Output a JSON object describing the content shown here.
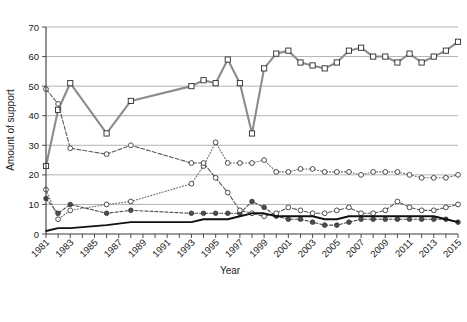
{
  "chart_data": {
    "type": "line",
    "title": "",
    "xlabel": "Year",
    "ylabel": "Amount of support",
    "xlim": [
      1981,
      2015
    ],
    "ylim": [
      0,
      70
    ],
    "yticks": [
      0,
      10,
      20,
      30,
      40,
      50,
      60,
      70
    ],
    "xticks": [
      1981,
      1983,
      1985,
      1987,
      1989,
      1991,
      1993,
      1995,
      1997,
      1999,
      2001,
      2003,
      2005,
      2007,
      2009,
      2011,
      2013,
      2015
    ],
    "x": [
      1981,
      1982,
      1983,
      1984,
      1985,
      1986,
      1987,
      1988,
      1989,
      1990,
      1991,
      1992,
      1993,
      1994,
      1995,
      1996,
      1997,
      1998,
      1999,
      2000,
      2001,
      2002,
      2003,
      2004,
      2005,
      2006,
      2007,
      2008,
      2009,
      2010,
      2011,
      2012,
      2013,
      2014,
      2015
    ],
    "grid": true,
    "legend_position": "bottom",
    "series": [
      {
        "name": "Support",
        "color": "#4d4d4d",
        "marker": "filled-circle",
        "dash": "3,2",
        "values": [
          12,
          7,
          10,
          null,
          null,
          7,
          null,
          8,
          null,
          null,
          null,
          null,
          7,
          7,
          7,
          7,
          7,
          11,
          9,
          6,
          5,
          5,
          4,
          3,
          3,
          4,
          5,
          5,
          5,
          5,
          5,
          5,
          5,
          5,
          4
        ]
      },
      {
        "name": "Remote justification",
        "color": "#6b6b6b",
        "marker": "open-circle",
        "dash": "1,2",
        "values": [
          15,
          5,
          8,
          null,
          null,
          10,
          null,
          11,
          null,
          null,
          null,
          null,
          17,
          23,
          31,
          24,
          24,
          24,
          25,
          21,
          21,
          22,
          22,
          21,
          21,
          21,
          20,
          21,
          21,
          21,
          20,
          19,
          19,
          19,
          20
        ]
      },
      {
        "name": "Total rejection",
        "color": "#8c8c8c",
        "marker": "open-square",
        "dash": "",
        "values": [
          23,
          42,
          51,
          null,
          null,
          34,
          null,
          45,
          null,
          null,
          null,
          null,
          50,
          52,
          51,
          59,
          51,
          34,
          56,
          61,
          62,
          58,
          57,
          56,
          58,
          62,
          63,
          60,
          60,
          58,
          61,
          58,
          60,
          62,
          65
        ]
      },
      {
        "name": "Indifference and Don't know/No reply",
        "color": "#5a5a5a",
        "marker": "open-circle",
        "dash": "4,2",
        "values": [
          49,
          44,
          29,
          null,
          null,
          27,
          null,
          30,
          null,
          null,
          null,
          null,
          24,
          24,
          19,
          14,
          8,
          7,
          6,
          7,
          9,
          8,
          7,
          7,
          8,
          9,
          7,
          7,
          8,
          11,
          9,
          8,
          8,
          9,
          10
        ]
      },
      {
        "name": "Fear",
        "color": "#111111",
        "marker": "none",
        "dash": "",
        "values": [
          1,
          2,
          2,
          null,
          null,
          3,
          null,
          4,
          null,
          null,
          null,
          null,
          4,
          5,
          5,
          5,
          6,
          7,
          7,
          6,
          6,
          6,
          6,
          5,
          5,
          6,
          6,
          6,
          6,
          6,
          6,
          6,
          6,
          5,
          4
        ]
      }
    ]
  },
  "legend": {
    "items": [
      {
        "label_line1": "Support",
        "label_line2": ""
      },
      {
        "label_line1": "Remote",
        "label_line2": "justification"
      },
      {
        "label_line1": "Total",
        "label_line2": "rejection"
      },
      {
        "label_line1": "Indifference and",
        "label_line2": "Don't know/No reply"
      },
      {
        "label_line1": "Fear",
        "label_line2": ""
      }
    ]
  }
}
